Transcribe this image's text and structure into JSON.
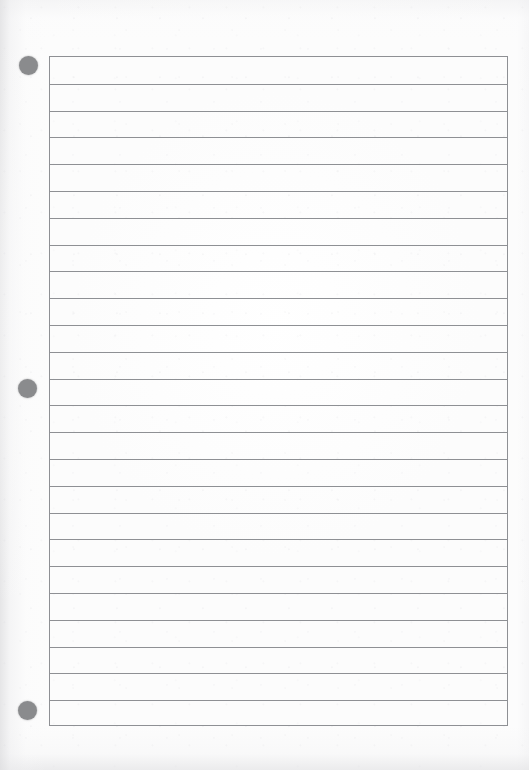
{
  "document": {
    "kind": "scanned-blank-lined-answer-sheet",
    "title": "",
    "visible_text": "",
    "orientation": "portrait",
    "page_width_px": 529,
    "page_height_px": 770,
    "paper_color": "#fcfcfc",
    "margin_shadow_color": "#dedee0"
  },
  "ruled_area": {
    "left_px": 49,
    "top_px": 56,
    "width_px": 459,
    "height_px": 670,
    "border_color": "#8e9094",
    "border_width_px": 1,
    "line_color": "#8e9094",
    "line_width_px": 1,
    "line_spacing_px": 26.8,
    "line_count": 24,
    "line_y_offsets": [
      26.8,
      53.6,
      80.4,
      107.2,
      134,
      160.8,
      187.6,
      214.4,
      241.2,
      268,
      294.8,
      321.6,
      348.4,
      375.2,
      402,
      428.8,
      455.6,
      482.4,
      509.2,
      536,
      562.8,
      589.6,
      616.4,
      643.2
    ]
  },
  "hole_punches": {
    "color": "#8a8b8d",
    "diameter_px": 19,
    "items": [
      {
        "label": "top-hole-punch",
        "center_x_px": 28,
        "center_y_px": 65
      },
      {
        "label": "middle-hole-punch",
        "center_x_px": 27,
        "center_y_px": 388
      },
      {
        "label": "bottom-hole-punch",
        "center_x_px": 27,
        "center_y_px": 710
      }
    ]
  }
}
